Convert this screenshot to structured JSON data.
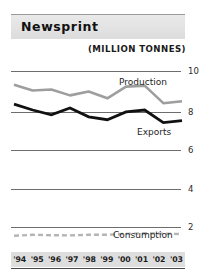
{
  "header": {
    "title": "Newsprint",
    "subtitle": "(MILLION TONNES)"
  },
  "chart_data": {
    "type": "line",
    "title": "Newsprint",
    "subtitle": "(MILLION TONNES)",
    "xlabel": "",
    "ylabel": "",
    "unit": "million tonnes",
    "categories": [
      "'94",
      "'95",
      "'96",
      "'97",
      "'98",
      "'99",
      "'00",
      "'01",
      "'02",
      "'03"
    ],
    "ylim": [
      0,
      10
    ],
    "yticks": [
      10,
      8,
      6,
      4,
      2
    ],
    "grid": true,
    "legend": "inline-labels",
    "series": [
      {
        "name": "Production",
        "color": "#9e9e9e",
        "style": "solid",
        "values": [
          9.3,
          9.0,
          9.05,
          8.75,
          8.95,
          8.6,
          9.2,
          9.25,
          8.35,
          8.45
        ]
      },
      {
        "name": "Exports",
        "color": "#111111",
        "style": "solid",
        "values": [
          8.3,
          8.0,
          7.75,
          8.1,
          7.65,
          7.5,
          7.9,
          8.0,
          7.35,
          7.45
        ]
      },
      {
        "name": "Consumption",
        "color": "#b5b5b5",
        "style": "dashed",
        "values": [
          1.55,
          1.6,
          1.58,
          1.57,
          1.6,
          1.6,
          1.65,
          1.68,
          1.66,
          1.64
        ]
      }
    ],
    "annotations": [
      {
        "text": "Production",
        "series": "Production"
      },
      {
        "text": "Exports",
        "series": "Exports"
      },
      {
        "text": "Consumption",
        "series": "Consumption"
      }
    ]
  }
}
